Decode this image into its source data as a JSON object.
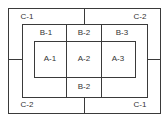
{
  "diagram": {
    "title": "",
    "line_color": "#3a3a3a",
    "regions": {
      "c_top_left": "C-1",
      "c_top_right": "C-2",
      "c_bottom_left": "C-2",
      "c_bottom_right": "C-1",
      "b_top_left": "B-1",
      "b_top_center": "B-2",
      "b_top_right": "B-3",
      "b_bottom_center": "B-2",
      "a_left": "A-1",
      "a_center": "A-2",
      "a_right": "A-3"
    }
  }
}
